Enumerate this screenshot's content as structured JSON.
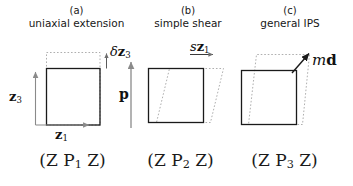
{
  "figure": {
    "width": 353,
    "height": 186,
    "background": "#ffffff",
    "stroke_solid": "#1a1a1a",
    "stroke_dotted": "#9a9a9a",
    "arrow_color": "#8a8a8a"
  },
  "panels": [
    {
      "letter": "(a)",
      "title": "uniaxial extension",
      "bottom_label_prefix": "(Z P",
      "bottom_label_sub": "1",
      "bottom_label_suffix": " Z)",
      "deformation": "uniaxial-extension"
    },
    {
      "letter": "(b)",
      "title": "simple shear",
      "bottom_label_prefix": "(Z P",
      "bottom_label_sub": "2",
      "bottom_label_suffix": " Z)",
      "deformation": "simple-shear"
    },
    {
      "letter": "(c)",
      "title": "general IPS",
      "bottom_label_prefix": "(Z P",
      "bottom_label_sub": "3",
      "bottom_label_suffix": " Z)",
      "deformation": "general-invariant-plane-strain"
    }
  ],
  "labels": {
    "axis_z3_sym": "z",
    "axis_z3_sub": "3",
    "axis_z1_sym": "z",
    "axis_z1_sub": "1",
    "delta_z3_delta": "δ",
    "delta_z3_sym": "z",
    "delta_z3_sub": "3",
    "habit_plane_normal": "p",
    "shear_s": "s",
    "shear_sym": "z",
    "shear_sub": "1",
    "displacement_m": "m",
    "displacement_d": "d"
  }
}
